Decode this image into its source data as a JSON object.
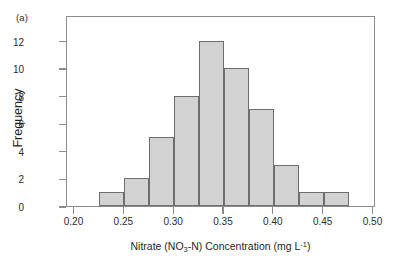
{
  "panel": {
    "label": "(a)"
  },
  "axes": {
    "y_title": "Frequency",
    "x_title_parts": {
      "pre": "Nitrate (NO",
      "sub": "3",
      "mid": "-N) Concentration (mg L",
      "sup": "-1",
      "post": ")"
    },
    "x_title_plain": "Nitrate (NO3-N) Concentration (mg L-1)"
  },
  "colors": {
    "bar_fill": "#d2d2d2",
    "bar_stroke": "#6e6e6e",
    "frame": "#8c8c8c",
    "text": "#1f1f1f",
    "background": "#ffffff"
  },
  "chart_data": {
    "type": "bar",
    "title": "",
    "subtitle": "",
    "xlabel": "Nitrate (NO3-N) Concentration (mg L-1)",
    "ylabel": "Frequency",
    "xlim": [
      0.1925,
      0.5025
    ],
    "ylim": [
      0,
      13.85
    ],
    "xticks": [
      0.2,
      0.25,
      0.3,
      0.35,
      0.4,
      0.45,
      0.5
    ],
    "xtick_labels": [
      "0.20",
      "0.25",
      "0.30",
      "0.35",
      "0.40",
      "0.45",
      "0.50"
    ],
    "yticks": [
      0,
      2,
      4,
      6,
      8,
      10,
      12
    ],
    "ytick_labels": [
      "0",
      "2",
      "4",
      "6",
      "8",
      "10",
      "12"
    ],
    "grid": false,
    "legend": null,
    "bin_width": 0.025,
    "bin_edges": [
      0.225,
      0.25,
      0.275,
      0.3,
      0.325,
      0.35,
      0.375,
      0.4,
      0.425,
      0.45,
      0.475
    ],
    "categories": [
      "0.225-0.250",
      "0.250-0.275",
      "0.275-0.300",
      "0.300-0.325",
      "0.325-0.350",
      "0.350-0.375",
      "0.375-0.400",
      "0.400-0.425",
      "0.425-0.450",
      "0.450-0.475"
    ],
    "values": [
      1,
      2,
      5,
      8,
      12,
      10,
      7,
      3,
      1,
      1
    ],
    "bin_centers": [
      0.2375,
      0.2625,
      0.2875,
      0.3125,
      0.3375,
      0.3625,
      0.3875,
      0.4125,
      0.4375,
      0.4625
    ],
    "annotations": [
      "(a)"
    ]
  }
}
